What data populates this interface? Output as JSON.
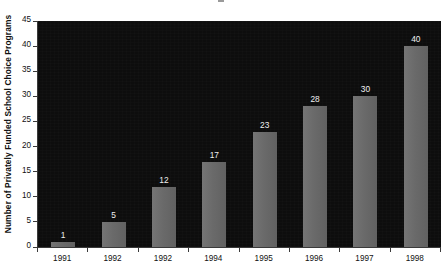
{
  "chart_data": {
    "type": "bar",
    "title": "",
    "subtitle": "",
    "xlabel": "",
    "ylabel": "Number of Privately Funded School Choice Programs",
    "categories": [
      "1991",
      "1992",
      "1992",
      "1994",
      "1995",
      "1996",
      "1997",
      "1998"
    ],
    "values": [
      1,
      5,
      12,
      17,
      23,
      28,
      30,
      40
    ],
    "data_labels": [
      "1",
      "5",
      "12",
      "17",
      "23",
      "28",
      "30",
      "40"
    ],
    "ylim": [
      0,
      45
    ],
    "ytick_values": [
      0,
      5,
      10,
      15,
      20,
      25,
      30,
      35,
      40,
      45
    ],
    "ytick_labels": [
      "0",
      "5",
      "10",
      "15",
      "20",
      "25",
      "30",
      "35",
      "40",
      "45"
    ],
    "grid": false,
    "legend": false,
    "legend_position": "none",
    "series": [
      {
        "name": "Privately Funded School Choice Programs",
        "values": [
          1,
          5,
          12,
          17,
          23,
          28,
          30,
          40
        ]
      }
    ]
  },
  "colors": {
    "plot_background": "#0d0d0d",
    "page_background": "#ffffff",
    "bar_fill": "#6b6b6b",
    "data_label_text": "#f0f0f0",
    "axis_text": "#111111",
    "axis_line": "#3a3a3a"
  }
}
